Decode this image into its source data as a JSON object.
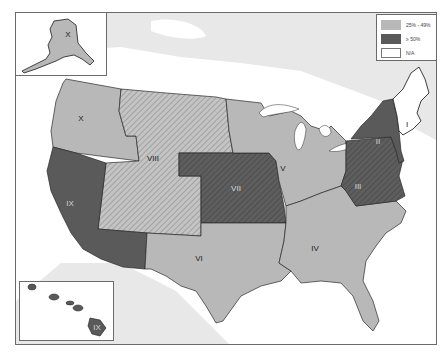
{
  "legend": {
    "items": [
      {
        "label": "25% - 49%",
        "color": "#b8b8b8",
        "pattern": "solid"
      },
      {
        "label": "≥ 50%",
        "color": "#5a5a5a",
        "pattern": "solid"
      },
      {
        "label": "N/A",
        "color": "#ffffff",
        "pattern": "solid"
      }
    ]
  },
  "regions": [
    {
      "id": "I",
      "label": "I",
      "category": "N/A",
      "fill": "#ffffff",
      "pattern": "none"
    },
    {
      "id": "II",
      "label": "II",
      "category": "≥ 50%",
      "fill": "#5a5a5a",
      "pattern": "none"
    },
    {
      "id": "III",
      "label": "III",
      "category": "≥ 50%",
      "fill": "#5a5a5a",
      "pattern": "hatch"
    },
    {
      "id": "IV",
      "label": "IV",
      "category": "25% - 49%",
      "fill": "#b8b8b8",
      "pattern": "none"
    },
    {
      "id": "V",
      "label": "V",
      "category": "25% - 49%",
      "fill": "#b8b8b8",
      "pattern": "none"
    },
    {
      "id": "VI",
      "label": "VI",
      "category": "25% - 49%",
      "fill": "#b8b8b8",
      "pattern": "none"
    },
    {
      "id": "VII",
      "label": "VII",
      "category": "≥ 50%",
      "fill": "#5a5a5a",
      "pattern": "hatch"
    },
    {
      "id": "VIII",
      "label": "VIII",
      "category": "25% - 49%",
      "fill": "#b8b8b8",
      "pattern": "hatch"
    },
    {
      "id": "IX",
      "label": "IX",
      "category": "≥ 50%",
      "fill": "#5a5a5a",
      "pattern": "none"
    },
    {
      "id": "X",
      "label": "X",
      "category": "25% - 49%",
      "fill": "#b8b8b8",
      "pattern": "none"
    }
  ],
  "insets": {
    "alaska": {
      "label": "X"
    },
    "hawaii": {
      "label": "IX"
    }
  },
  "colors": {
    "background_land": "#e9e9e9",
    "water": "#ffffff",
    "border": "#2a2a2a",
    "frame": "#6a6a6a"
  }
}
